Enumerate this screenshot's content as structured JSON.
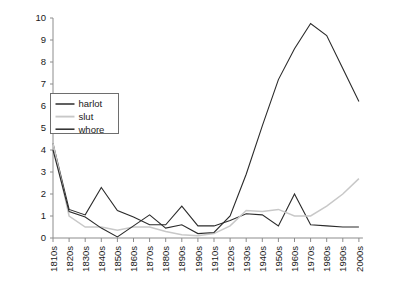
{
  "chart_data": {
    "type": "line",
    "title": "",
    "xlabel": "",
    "ylabel": "",
    "ylim": [
      0,
      10
    ],
    "yticks": [
      0,
      1,
      2,
      3,
      4,
      5,
      6,
      7,
      8,
      9,
      10
    ],
    "grid": false,
    "legend_position": "upper-left",
    "categories": [
      "1810s",
      "1820s",
      "1830s",
      "1840s",
      "1850s",
      "1860s",
      "1870s",
      "1880s",
      "1890s",
      "1990s",
      "1910s",
      "1920s",
      "1930s",
      "1940s",
      "1950s",
      "1960s",
      "1970s",
      "1980s",
      "1990s",
      "2000s"
    ],
    "series": [
      {
        "name": "harlot",
        "color": "#2b2b2b",
        "values": [
          4.3,
          1.3,
          1.05,
          2.3,
          1.25,
          0.95,
          0.6,
          0.6,
          1.45,
          0.55,
          0.55,
          0.8,
          1.1,
          1.05,
          0.55,
          2.0,
          0.6,
          0.55,
          0.5,
          0.5
        ]
      },
      {
        "name": "slut",
        "color": "#c8c8c8",
        "values": [
          4.3,
          1.0,
          0.5,
          0.5,
          0.35,
          0.5,
          0.5,
          0.3,
          0.15,
          0.1,
          0.2,
          0.55,
          1.25,
          1.2,
          1.3,
          1.0,
          1.0,
          1.45,
          2.0,
          2.7
        ]
      },
      {
        "name": "whore",
        "color": "#2b2b2b",
        "values": [
          4.0,
          1.2,
          0.95,
          0.45,
          0.05,
          0.55,
          1.05,
          0.45,
          0.6,
          0.2,
          0.25,
          1.0,
          2.9,
          5.1,
          7.2,
          8.6,
          9.75,
          9.2,
          7.7,
          6.2
        ]
      }
    ]
  },
  "legend": {
    "entries": [
      {
        "label": "harlot"
      },
      {
        "label": "slut"
      },
      {
        "label": "whore"
      }
    ]
  }
}
